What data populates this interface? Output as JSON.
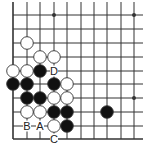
{
  "diagram": {
    "type": "go-board-fragment",
    "grid": {
      "cols_x": [
        13,
        27,
        40,
        54,
        67,
        81,
        94,
        107,
        121,
        134
      ],
      "rows_y": [
        15,
        29,
        43,
        57,
        71,
        84,
        98,
        112,
        126,
        139
      ],
      "top_extent": 2,
      "right_extent": 143,
      "left_edge": true,
      "bottom_edge": true
    },
    "star_points": [
      [
        3,
        0
      ],
      [
        9,
        0
      ],
      [
        9,
        6
      ]
    ],
    "stones": [
      {
        "color": "white",
        "col": 1,
        "row": 2
      },
      {
        "color": "white",
        "col": 2,
        "row": 3
      },
      {
        "color": "white",
        "col": 3,
        "row": 3
      },
      {
        "color": "white",
        "col": 0,
        "row": 4
      },
      {
        "color": "white",
        "col": 1,
        "row": 4
      },
      {
        "color": "black",
        "col": 2,
        "row": 4
      },
      {
        "color": "black",
        "col": 0,
        "row": 5
      },
      {
        "color": "black",
        "col": 1,
        "row": 5
      },
      {
        "color": "black",
        "col": 3,
        "row": 5
      },
      {
        "color": "white",
        "col": 4,
        "row": 5
      },
      {
        "color": "black",
        "col": 1,
        "row": 6
      },
      {
        "color": "black",
        "col": 2,
        "row": 6
      },
      {
        "color": "white",
        "col": 3,
        "row": 6
      },
      {
        "color": "white",
        "col": 4,
        "row": 6
      },
      {
        "color": "white",
        "col": 1,
        "row": 7
      },
      {
        "color": "white",
        "col": 2,
        "row": 7
      },
      {
        "color": "black",
        "col": 3,
        "row": 7
      },
      {
        "color": "black",
        "col": 4,
        "row": 7
      },
      {
        "color": "black",
        "col": 7,
        "row": 7
      },
      {
        "color": "white",
        "col": 3,
        "row": 8
      },
      {
        "color": "black",
        "col": 4,
        "row": 8
      }
    ],
    "labels": [
      {
        "text": "D",
        "col": 3,
        "row": 4
      },
      {
        "text": "B",
        "col": 1,
        "row": 8
      },
      {
        "text": "A",
        "col": 2,
        "row": 8
      },
      {
        "text": "C",
        "col": 3,
        "row": 9
      }
    ],
    "colors": {
      "line": "#333333",
      "black_stone": "#111111",
      "white_stone": "#ffffff",
      "background": "#ffffff"
    }
  }
}
